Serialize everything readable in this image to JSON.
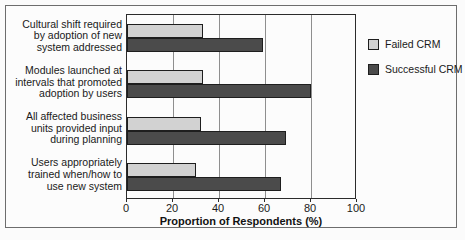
{
  "chart_data": {
    "type": "bar",
    "orientation": "horizontal",
    "title": "",
    "xlabel": "Proportion of Respondents (%)",
    "ylabel": "",
    "xlim": [
      0,
      100
    ],
    "xticks": [
      0,
      20,
      40,
      60,
      80,
      100
    ],
    "grid": true,
    "legend_position": "right",
    "categories": [
      "Cultural shift required by adoption of new system addressed",
      "Modules launched at intervals that promoted adoption by users",
      "All affected business units provided input during planning",
      "Users appropriately trained when/how to use new system"
    ],
    "category_lines": [
      [
        "Cultural shift required",
        "by adoption of new",
        "system addressed"
      ],
      [
        "Modules launched at",
        "intervals that promoted",
        "adoption by users"
      ],
      [
        "All affected business",
        "units provided input",
        "during planning"
      ],
      [
        "Users appropriately",
        "trained when/how to",
        "use new system"
      ]
    ],
    "series": [
      {
        "name": "Failed CRM",
        "color": "#d2d2d2",
        "values": [
          33,
          33,
          32,
          30
        ]
      },
      {
        "name": "Successful CRM",
        "color": "#4b4b4b",
        "values": [
          59,
          80,
          69,
          67
        ]
      }
    ]
  },
  "legend": {
    "items": [
      {
        "label": "Failed CRM",
        "color": "#d2d2d2"
      },
      {
        "label": "Successful CRM",
        "color": "#4b4b4b"
      }
    ]
  },
  "axis": {
    "x_title": "Proportion of Respondents (%)",
    "x_tick_labels": [
      "0",
      "20",
      "40",
      "60",
      "80",
      "100"
    ]
  }
}
